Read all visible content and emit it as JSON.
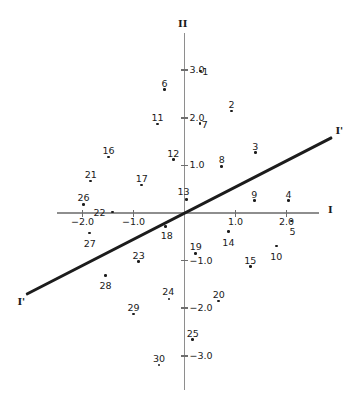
{
  "chart_data": {
    "type": "scatter",
    "title": "",
    "subtitle": "",
    "xlabel": "I",
    "ylabel": "II",
    "legend": [],
    "grid": false,
    "xlim": [
      -2.6,
      2.6
    ],
    "ylim": [
      -3.6,
      3.6
    ],
    "xticks": [
      -2.0,
      -1.0,
      1.0,
      2.0
    ],
    "xticklabels": [
      "−2.0",
      "−1.0",
      "1.0",
      "2.0"
    ],
    "yticks": [
      3.0,
      2.0,
      1.0,
      -1.0,
      -2.0,
      -3.0
    ],
    "yticklabels": [
      "3.0",
      "2.0",
      "1.0",
      "−1.0",
      "−2.0",
      "−3.0"
    ],
    "point_label_position": "above",
    "annotations": [
      {
        "text": "I'",
        "role": "regression-line-end-upper-right"
      },
      {
        "text": "I'",
        "role": "regression-line-end-lower-left"
      }
    ],
    "series": [
      {
        "name": "observations",
        "marker": "dot",
        "color": "#1c1c1c",
        "points": [
          {
            "label": "1",
            "x": 0.31,
            "y": 2.98
          },
          {
            "label": "2",
            "x": 0.92,
            "y": 2.14
          },
          {
            "label": "3",
            "x": 1.39,
            "y": 1.27
          },
          {
            "label": "4",
            "x": 2.04,
            "y": 0.26
          },
          {
            "label": "5",
            "x": 2.1,
            "y": -0.17
          },
          {
            "label": "6",
            "x": -0.39,
            "y": 2.59
          },
          {
            "label": "7",
            "x": 0.3,
            "y": 1.88
          },
          {
            "label": "8",
            "x": 0.73,
            "y": 0.98
          },
          {
            "label": "9",
            "x": 1.37,
            "y": 0.26
          },
          {
            "label": "10",
            "x": 1.8,
            "y": -0.69
          },
          {
            "label": "11",
            "x": -0.53,
            "y": 1.87
          },
          {
            "label": "12",
            "x": -0.22,
            "y": 1.12
          },
          {
            "label": "13",
            "x": 0.04,
            "y": 0.28
          },
          {
            "label": "14",
            "x": 0.86,
            "y": -0.39
          },
          {
            "label": "15",
            "x": 1.29,
            "y": -1.13
          },
          {
            "label": "16",
            "x": -1.49,
            "y": 1.18
          },
          {
            "label": "17",
            "x": -0.84,
            "y": 0.59
          },
          {
            "label": "18",
            "x": -0.37,
            "y": -0.28
          },
          {
            "label": "19",
            "x": 0.22,
            "y": -0.85
          },
          {
            "label": "20",
            "x": 0.67,
            "y": -1.85
          },
          {
            "label": "21",
            "x": -1.84,
            "y": 0.67
          },
          {
            "label": "22",
            "x": -1.41,
            "y": 0.02
          },
          {
            "label": "23",
            "x": -0.9,
            "y": -1.02
          },
          {
            "label": "24",
            "x": -0.3,
            "y": -1.81
          },
          {
            "label": "25",
            "x": 0.16,
            "y": -2.66
          },
          {
            "label": "26",
            "x": -1.98,
            "y": 0.18
          },
          {
            "label": "27",
            "x": -1.86,
            "y": -0.42
          },
          {
            "label": "28",
            "x": -1.55,
            "y": -1.31
          },
          {
            "label": "29",
            "x": -1.0,
            "y": -2.12
          },
          {
            "label": "30",
            "x": -0.5,
            "y": -3.19
          }
        ]
      }
    ],
    "regression_line": {
      "label": "I'",
      "slope": 0.55,
      "intercept": 0.0,
      "x_start": -3.1,
      "x_end": 2.9,
      "color": "#1c1c1c"
    },
    "axis_colors": {
      "axis": "#8e8e8e",
      "tick": "#6e6e6e",
      "text": "#1a1a1a",
      "background": "#ffffff"
    }
  }
}
